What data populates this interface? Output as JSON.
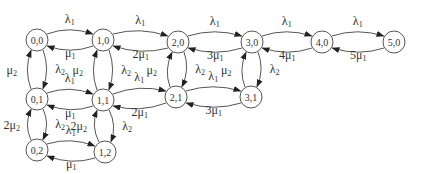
{
  "diagram": {
    "type": "state-transition-diagram",
    "nodes": [
      {
        "id": "0,0",
        "label": "0,0",
        "x": 37,
        "y": 40
      },
      {
        "id": "1,0",
        "label": "1,0",
        "x": 103,
        "y": 40
      },
      {
        "id": "2,0",
        "label": "2,0",
        "x": 178,
        "y": 42
      },
      {
        "id": "3,0",
        "label": "3,0",
        "x": 252,
        "y": 42
      },
      {
        "id": "4,0",
        "label": "4,0",
        "x": 322,
        "y": 42
      },
      {
        "id": "5,0",
        "label": "5,0",
        "x": 394,
        "y": 42
      },
      {
        "id": "0,1",
        "label": "0,1",
        "x": 37,
        "y": 99
      },
      {
        "id": "1,1",
        "label": "1,1",
        "x": 103,
        "y": 100
      },
      {
        "id": "2,1",
        "label": "2,1",
        "x": 176,
        "y": 97
      },
      {
        "id": "3,1",
        "label": "3,1",
        "x": 251,
        "y": 97
      },
      {
        "id": "0,2",
        "label": "0,2",
        "x": 37,
        "y": 150
      },
      {
        "id": "1,2",
        "label": "1,2",
        "x": 105,
        "y": 152
      }
    ],
    "edges": [
      {
        "from": "0,0",
        "to": "1,0",
        "label": "λ1"
      },
      {
        "from": "1,0",
        "to": "0,0",
        "label": "μ1"
      },
      {
        "from": "1,0",
        "to": "2,0",
        "label": "λ1"
      },
      {
        "from": "2,0",
        "to": "1,0",
        "label": "2μ1"
      },
      {
        "from": "2,0",
        "to": "3,0",
        "label": "λ1"
      },
      {
        "from": "3,0",
        "to": "2,0",
        "label": "3μ1"
      },
      {
        "from": "3,0",
        "to": "4,0",
        "label": "λ1"
      },
      {
        "from": "4,0",
        "to": "3,0",
        "label": "4μ1"
      },
      {
        "from": "4,0",
        "to": "5,0",
        "label": "λ1"
      },
      {
        "from": "5,0",
        "to": "4,0",
        "label": "5μ1"
      },
      {
        "from": "0,1",
        "to": "1,1",
        "label": "λ1"
      },
      {
        "from": "1,1",
        "to": "0,1",
        "label": "μ1"
      },
      {
        "from": "1,1",
        "to": "2,1",
        "label": "λ1"
      },
      {
        "from": "2,1",
        "to": "1,1",
        "label": "2μ1"
      },
      {
        "from": "2,1",
        "to": "3,1",
        "label": "λ1"
      },
      {
        "from": "3,1",
        "to": "2,1",
        "label": "3μ1"
      },
      {
        "from": "0,2",
        "to": "1,2",
        "label": "λ1"
      },
      {
        "from": "1,2",
        "to": "0,2",
        "label": "μ1"
      },
      {
        "from": "0,0",
        "to": "0,1",
        "label": "λ2"
      },
      {
        "from": "0,1",
        "to": "0,0",
        "label": "μ2"
      },
      {
        "from": "1,0",
        "to": "1,1",
        "label": "λ2"
      },
      {
        "from": "1,1",
        "to": "1,0",
        "label": "μ2"
      },
      {
        "from": "2,0",
        "to": "2,1",
        "label": "λ2"
      },
      {
        "from": "2,1",
        "to": "2,0",
        "label": "μ2"
      },
      {
        "from": "3,0",
        "to": "3,1",
        "label": "λ2"
      },
      {
        "from": "3,1",
        "to": "3,0",
        "label": "μ2"
      },
      {
        "from": "0,1",
        "to": "0,2",
        "label": "λ2"
      },
      {
        "from": "0,2",
        "to": "0,1",
        "label": "2μ2"
      },
      {
        "from": "1,1",
        "to": "1,2",
        "label": "λ2"
      },
      {
        "from": "1,2",
        "to": "1,1",
        "label": "2μ2"
      }
    ]
  }
}
